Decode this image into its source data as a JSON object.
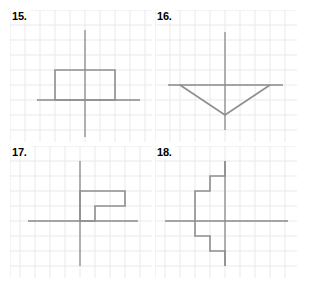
{
  "worksheet": {
    "title": "Coordinate grid figures worksheet",
    "background_color": "#ffffff",
    "grid_color": "#e9e9e9",
    "axis_color": "#8a8a8a",
    "figure_color": "#8e8e8e",
    "label_color": "#000000",
    "cell_size": 15,
    "columns": 9,
    "rows": 8
  },
  "problems": [
    {
      "label": "15.",
      "name": "problem-15",
      "shape": "rectangle",
      "description": "Rectangle sitting on the horizontal axis, crossed by the vertical axis",
      "origin": {
        "x": 75,
        "y": 90
      },
      "axes": {
        "vertical": {
          "x1": 75,
          "y1": 20,
          "x2": 75,
          "y2": 127
        },
        "horizontal": {
          "x1": 27,
          "y1": 90,
          "x2": 130,
          "y2": 90
        }
      },
      "figure_points": "45,90 45,60 105,60 105,90 45,90"
    },
    {
      "label": "16.",
      "name": "problem-16",
      "shape": "triangle",
      "description": "Downward pointing triangle with apex below the horizontal axis",
      "origin": {
        "x": 70,
        "y": 75
      },
      "axes": {
        "vertical": {
          "x1": 70,
          "y1": 22,
          "x2": 70,
          "y2": 120
        },
        "horizontal": {
          "x1": 13,
          "y1": 75,
          "x2": 128,
          "y2": 75
        }
      },
      "figure_points": "25,75 70,105 115,75"
    },
    {
      "label": "17.",
      "name": "problem-17",
      "shape": "step-polygon",
      "description": "Two step L-shaped polygon above and right of the origin",
      "origin": {
        "x": 70,
        "y": 75
      },
      "axes": {
        "vertical": {
          "x1": 70,
          "y1": 15,
          "x2": 70,
          "y2": 120
        },
        "horizontal": {
          "x1": 18,
          "y1": 75,
          "x2": 128,
          "y2": 75
        }
      },
      "figure_points": "70,75 70,45 115,45 115,60 85,60 85,75 70,75"
    },
    {
      "label": "18.",
      "name": "problem-18",
      "shape": "staircase-polygon",
      "description": "Zigzag staircase polygon straddling the vertical axis",
      "origin": {
        "x": 70,
        "y": 75
      },
      "axes": {
        "vertical": {
          "x1": 70,
          "y1": 15,
          "x2": 70,
          "y2": 120
        },
        "horizontal": {
          "x1": 10,
          "y1": 75,
          "x2": 133,
          "y2": 75
        }
      },
      "figure_points": "70,15 70,30 55,30 55,45 40,45 40,75 40,90 55,90 55,105 70,105 70,120"
    }
  ]
}
